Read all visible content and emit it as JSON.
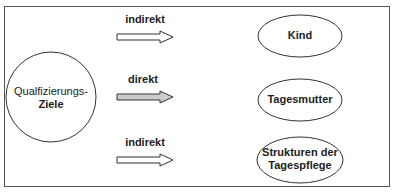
{
  "diagram": {
    "source_node": {
      "line1": "Qualfizierungs-",
      "line2": "Ziele"
    },
    "edges": [
      {
        "label": "indirekt",
        "style": "outline"
      },
      {
        "label": "direkt",
        "style": "filled"
      },
      {
        "label": "indirekt",
        "style": "outline"
      }
    ],
    "targets": [
      {
        "label": "Kind"
      },
      {
        "label": "Tagesmutter"
      },
      {
        "line1": "Strukturen der",
        "line2": "Tagespflege"
      }
    ],
    "colors": {
      "stroke": "#333333",
      "filled_arrow": "#cccccc",
      "background": "#ffffff"
    }
  }
}
